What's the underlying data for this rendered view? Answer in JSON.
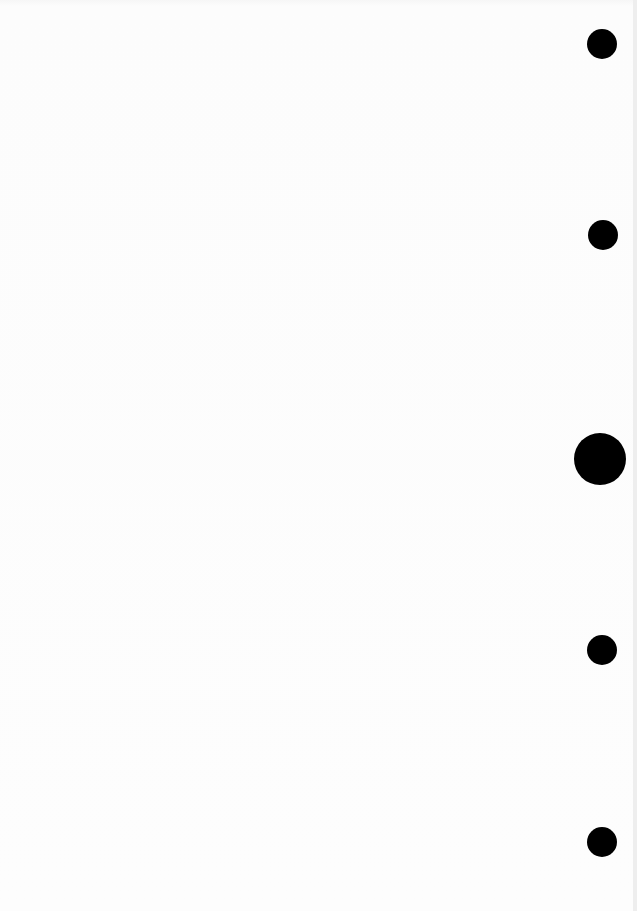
{
  "page": {
    "type": "blank scanned sheet",
    "background_color": "#fbfbfb",
    "text": ""
  },
  "punch_holes": [
    {
      "cx": 602,
      "cy": 44,
      "r": 15
    },
    {
      "cx": 603,
      "cy": 235,
      "r": 15
    },
    {
      "cx": 600,
      "cy": 459,
      "r": 26
    },
    {
      "cx": 602,
      "cy": 650,
      "r": 15
    },
    {
      "cx": 602,
      "cy": 842,
      "r": 15
    }
  ]
}
